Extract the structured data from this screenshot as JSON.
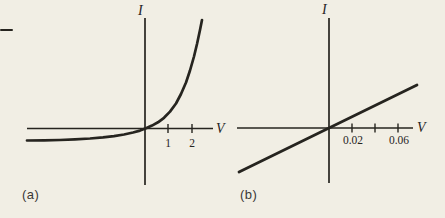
{
  "canvas": {
    "width": 445,
    "height": 218,
    "background": "#f1eee4",
    "ink": "#26241f"
  },
  "margin_mark": {
    "description": "short horizontal rule fragment at left page edge"
  },
  "figures": [
    {
      "caption": "(a)",
      "y_label": "I",
      "x_label": "V",
      "ticks": [
        {
          "value": 1,
          "label": "1"
        },
        {
          "value": 2,
          "label": "2"
        }
      ],
      "curve_name": "diode exponential I-V characteristic",
      "curve_px": [
        [
          27,
          140.5
        ],
        [
          44,
          140.3
        ],
        [
          60,
          140
        ],
        [
          75,
          139.4
        ],
        [
          90,
          138.5
        ],
        [
          103,
          137.4
        ],
        [
          114,
          136.1
        ],
        [
          124,
          134.5
        ],
        [
          133,
          132.5
        ],
        [
          140,
          130.6
        ],
        [
          146,
          128.3
        ],
        [
          152,
          125.6
        ],
        [
          158,
          122.3
        ],
        [
          164,
          117.8
        ],
        [
          170,
          111.6
        ],
        [
          176,
          103.5
        ],
        [
          181,
          94
        ],
        [
          186,
          82.5
        ],
        [
          190,
          70.5
        ],
        [
          194,
          56.5
        ],
        [
          197,
          44
        ],
        [
          200,
          30
        ],
        [
          202,
          20
        ]
      ]
    },
    {
      "caption": "(b)",
      "y_label": "I",
      "x_label": "V",
      "ticks": [
        {
          "value": 0.02,
          "label": "0.02"
        },
        {
          "value": 0.04,
          "label": ""
        },
        {
          "value": 0.06,
          "label": "0.06"
        }
      ],
      "curve_name": "resistor linear I-V characteristic",
      "line_px": [
        [
          239,
          172
        ],
        [
          329,
          128
        ],
        [
          417,
          85
        ]
      ]
    }
  ],
  "chart_data": [
    {
      "type": "line",
      "subplot": "(a)",
      "title": "",
      "xlabel": "V",
      "ylabel": "I",
      "x_ticks": [
        1,
        2
      ],
      "x_range": [
        -5.0,
        2.45
      ],
      "y_ticks": [],
      "grid": false,
      "legend": false,
      "series": [
        {
          "name": "diode exponential characteristic",
          "x": [
            -5.0,
            -4.0,
            -3.0,
            -2.0,
            -1.0,
            -0.5,
            0,
            0.3,
            0.6,
            0.8,
            1.0,
            1.3,
            1.6,
            1.9,
            2.1,
            2.3,
            2.43
          ],
          "y": [
            -1.0,
            -0.99,
            -0.97,
            -0.88,
            -0.62,
            -0.38,
            0,
            0.35,
            0.75,
            0.95,
            1.45,
            2.1,
            3.4,
            5.2,
            6.9,
            8.5,
            9.0
          ]
        }
      ],
      "note": "y-axis unlabeled; values in arbitrary units with reverse saturation current normalized to 1"
    },
    {
      "type": "line",
      "subplot": "(b)",
      "title": "",
      "xlabel": "V",
      "ylabel": "I",
      "x_ticks": [
        0.02,
        0.06
      ],
      "x_range": [
        -0.078,
        0.077
      ],
      "y_ticks": [],
      "grid": false,
      "legend": false,
      "series": [
        {
          "name": "resistor linear characteristic",
          "x": [
            -0.078,
            0,
            0.0765
          ],
          "y": [
            -1.91,
            0,
            1.87
          ]
        }
      ],
      "note": "y-axis unlabeled; straight line through the origin (ohmic)"
    }
  ]
}
